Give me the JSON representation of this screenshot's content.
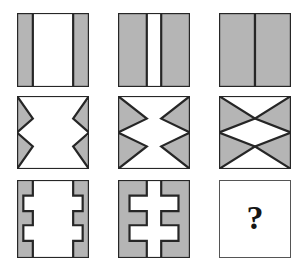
{
  "puzzle": {
    "type": "visual-analogy-matrix",
    "rows": 3,
    "columns": 3,
    "answer_marker": "?",
    "colors": {
      "fill": "#b5b5b5",
      "stroke": "#262626",
      "background": "#ffffff",
      "answer_border": "#555555",
      "answer_text": "#151515"
    },
    "cells": [
      {
        "id": "cell-r1c1",
        "row": 1,
        "column": 1,
        "name": "vertical-bars-narrow",
        "description": "Square with two narrow gray vertical bars at the left and right edges and a wide white gap between them.",
        "x": 17,
        "y": 13,
        "w": 72,
        "h": 74,
        "bar_width_fraction": 0.22
      },
      {
        "id": "cell-r1c2",
        "row": 1,
        "column": 2,
        "name": "vertical-bars-wide",
        "description": "Square with two wide gray vertical bars at the left and right edges and a narrow white gap between them.",
        "x": 118,
        "y": 13,
        "w": 72,
        "h": 74,
        "bar_width_fraction": 0.4
      },
      {
        "id": "cell-r1c3",
        "row": 1,
        "column": 3,
        "name": "vertical-bars-merged",
        "description": "Square fully filled gray, the two bars have met in the centre leaving only a thin dividing line.",
        "x": 219,
        "y": 13,
        "w": 72,
        "h": 74,
        "bar_width_fraction": 0.5
      },
      {
        "id": "cell-r2c1",
        "row": 2,
        "column": 1,
        "name": "triangles-narrow",
        "description": "Square with four small gray triangles pointing inward from the left and right edges, large white centre.",
        "x": 17,
        "y": 96,
        "w": 72,
        "h": 73,
        "reach_fraction": 0.22
      },
      {
        "id": "cell-r2c2",
        "row": 2,
        "column": 2,
        "name": "triangles-wide",
        "description": "Square with four larger gray triangles reaching further toward the centre, narrow white channel remains.",
        "x": 118,
        "y": 96,
        "w": 72,
        "h": 73,
        "reach_fraction": 0.4
      },
      {
        "id": "cell-r2c3",
        "row": 2,
        "column": 3,
        "name": "triangles-merged",
        "description": "Square where the triangles meet at the centre forming a bowtie, leaving a white diamond in the middle.",
        "x": 219,
        "y": 96,
        "w": 72,
        "h": 73,
        "reach_fraction": 0.5
      },
      {
        "id": "cell-r3c1",
        "row": 3,
        "column": 1,
        "name": "combs-narrow",
        "description": "Square with two narrow gray comb shapes at the left and right edges, each with two rectangular notches, wide white gap.",
        "x": 17,
        "y": 180,
        "w": 72,
        "h": 78,
        "bar_width_fraction": 0.22
      },
      {
        "id": "cell-r3c2",
        "row": 3,
        "column": 2,
        "name": "combs-wide",
        "description": "Square with two wide gray comb shapes reaching further inward, narrow white channel between them.",
        "x": 118,
        "y": 180,
        "w": 72,
        "h": 78,
        "bar_width_fraction": 0.4
      },
      {
        "id": "cell-r3c3",
        "row": 3,
        "column": 3,
        "name": "answer-slot",
        "description": "Empty white square containing a bold question mark, the missing answer of the matrix.",
        "x": 219,
        "y": 180,
        "w": 72,
        "h": 78,
        "is_answer": true
      }
    ]
  }
}
